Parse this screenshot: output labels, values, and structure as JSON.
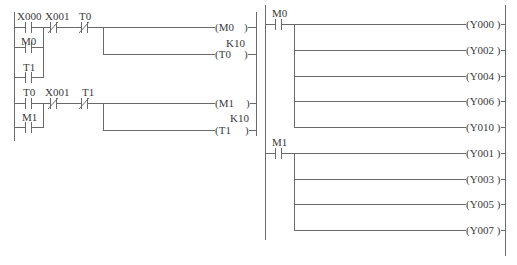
{
  "diagram": {
    "type": "PLC ladder diagram",
    "line_color": "#6a6a6a",
    "left_program": {
      "rungs": [
        {
          "contacts": [
            {
              "label": "X000",
              "type": "NO"
            },
            {
              "label": "X001",
              "type": "NC"
            },
            {
              "label": "T0",
              "type": "NC"
            }
          ],
          "parallel_contacts": [
            {
              "label": "M0",
              "type": "NO"
            },
            {
              "label": "T1",
              "type": "NO"
            }
          ],
          "outputs": [
            {
              "label": "(M0",
              "close": ")"
            },
            {
              "label": "(T0",
              "close": ")",
              "preset": "K10"
            }
          ]
        },
        {
          "contacts": [
            {
              "label": "T0",
              "type": "NO"
            },
            {
              "label": "X001",
              "type": "NC"
            },
            {
              "label": "T1",
              "type": "NC"
            }
          ],
          "parallel_contacts": [
            {
              "label": "M1",
              "type": "NO"
            }
          ],
          "outputs": [
            {
              "label": "(M1",
              "close": ")"
            },
            {
              "label": "(T1",
              "close": ")",
              "preset": "K10"
            }
          ]
        }
      ]
    },
    "right_program": {
      "rungs": [
        {
          "contact": {
            "label": "M0",
            "type": "NO"
          },
          "outputs": [
            "(Y000 )",
            "(Y002 )",
            "(Y004 )",
            "(Y006 )",
            "(Y010 )"
          ]
        },
        {
          "contact": {
            "label": "M1",
            "type": "NO"
          },
          "outputs": [
            "(Y001 )",
            "(Y003 )",
            "(Y005 )",
            "(Y007 )"
          ]
        }
      ]
    }
  }
}
